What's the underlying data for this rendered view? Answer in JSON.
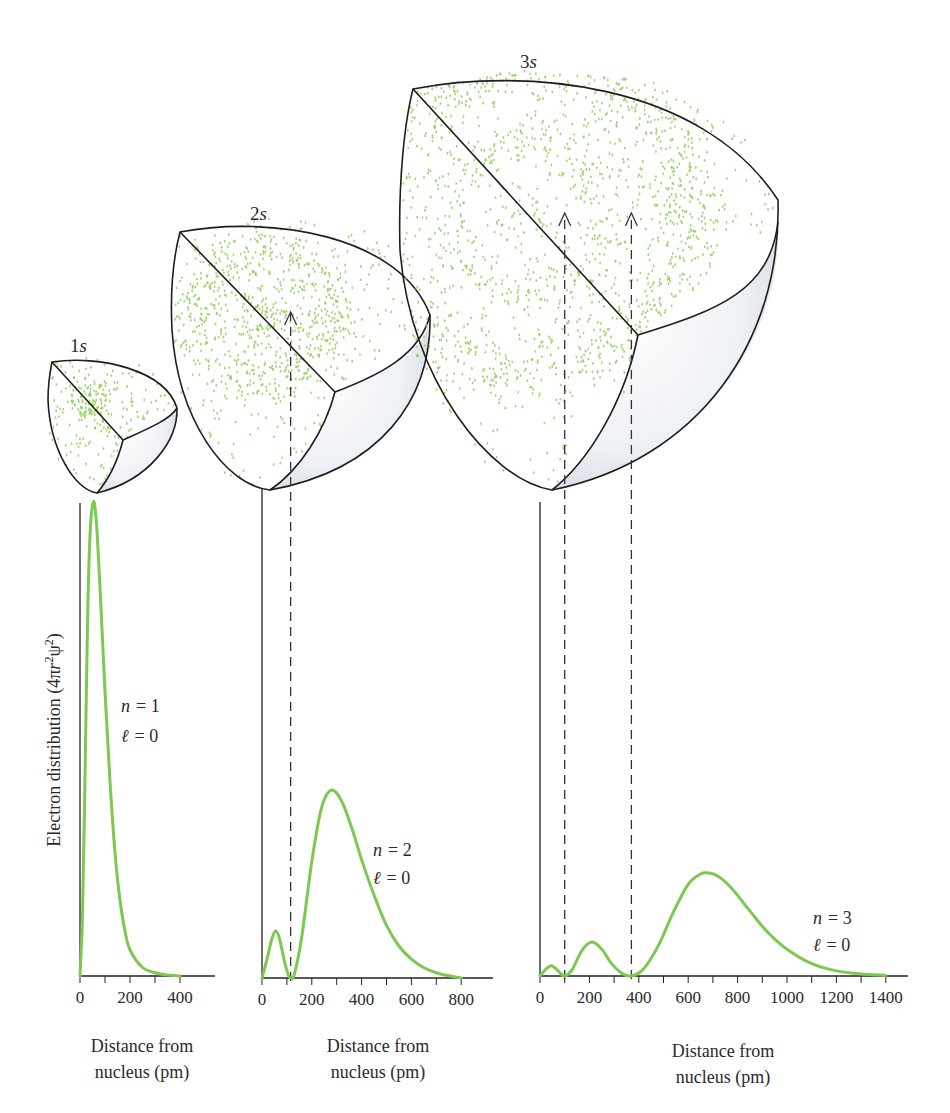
{
  "figure": {
    "ylabel": "Electron distribution (4πr²ψ²)",
    "ylabel_parts": {
      "prefix": "Electron distribution (4π",
      "r": "r",
      "sup1": "2",
      "psi": "ψ",
      "sup2": "2",
      "suffix": ")"
    },
    "orbitals": [
      {
        "label_num": "1",
        "label_sym": "s"
      },
      {
        "label_num": "2",
        "label_sym": "s"
      },
      {
        "label_num": "3",
        "label_sym": "s"
      }
    ],
    "colors": {
      "curve": "#7cc850",
      "dots": "#8fd05a",
      "outline": "#1e1e1e",
      "shade": "#d6dde6"
    }
  },
  "chart_data": [
    {
      "type": "line",
      "title": "1s",
      "xlabel": "Distance from nucleus (pm)",
      "xlabel_lines": [
        "Distance from",
        "nucleus (pm)"
      ],
      "ylabel": "Electron distribution (4πr²ψ²)",
      "annotation": {
        "n": "n = 1",
        "l": "ℓ = 0",
        "n_sym": "n",
        "n_val": "= 1",
        "l_sym": "ℓ",
        "l_val": "= 0"
      },
      "xlim": [
        0,
        540
      ],
      "xticks": [
        0,
        100,
        200,
        300,
        400
      ],
      "xtick_labels": [
        "0",
        "200",
        "400"
      ],
      "xtick_label_values": [
        0,
        200,
        400
      ],
      "nodes_pm": [],
      "x": [
        0,
        10,
        20,
        30,
        40,
        53,
        65,
        80,
        100,
        120,
        140,
        160,
        180,
        200,
        250,
        300,
        350,
        400
      ],
      "y": [
        0,
        0.13,
        0.42,
        0.74,
        0.93,
        1.0,
        0.96,
        0.82,
        0.6,
        0.41,
        0.26,
        0.16,
        0.095,
        0.055,
        0.018,
        0.007,
        0.002,
        0.0
      ]
    },
    {
      "type": "line",
      "title": "2s",
      "xlabel": "Distance from nucleus (pm)",
      "xlabel_lines": [
        "Distance from",
        "nucleus (pm)"
      ],
      "ylabel": "Electron distribution (4πr²ψ²)",
      "annotation": {
        "n": "n = 2",
        "l": "ℓ = 0",
        "n_sym": "n",
        "n_val": "= 2",
        "l_sym": "ℓ",
        "l_val": "= 0"
      },
      "xlim": [
        0,
        930
      ],
      "xticks": [
        0,
        100,
        200,
        300,
        400,
        500,
        600,
        700,
        800
      ],
      "xtick_labels": [
        "0",
        "200",
        "400",
        "600",
        "800"
      ],
      "xtick_label_values": [
        0,
        200,
        400,
        600,
        800
      ],
      "nodes_pm": [
        115
      ],
      "x": [
        0,
        20,
        40,
        55,
        70,
        90,
        105,
        115,
        130,
        160,
        200,
        240,
        280,
        320,
        360,
        400,
        450,
        500,
        550,
        600,
        650,
        700,
        750,
        800
      ],
      "y": [
        0,
        0.1,
        0.21,
        0.25,
        0.21,
        0.09,
        0.02,
        0.0,
        0.02,
        0.22,
        0.62,
        0.91,
        1.0,
        0.94,
        0.8,
        0.63,
        0.44,
        0.28,
        0.17,
        0.1,
        0.055,
        0.028,
        0.012,
        0.0
      ]
    },
    {
      "type": "line",
      "title": "3s",
      "xlabel": "Distance from nucleus (pm)",
      "xlabel_lines": [
        "Distance from",
        "nucleus (pm)"
      ],
      "ylabel": "Electron distribution (4πr²ψ²)",
      "annotation": {
        "n": "n = 3",
        "l": "ℓ = 0",
        "n_sym": "n",
        "n_val": "= 3",
        "l_sym": "ℓ",
        "l_val": "= 0"
      },
      "xlim": [
        0,
        1480
      ],
      "xticks": [
        0,
        100,
        200,
        300,
        400,
        500,
        600,
        700,
        800,
        900,
        1000,
        1100,
        1200,
        1300,
        1400
      ],
      "xtick_labels": [
        "0",
        "200",
        "400",
        "600",
        "800",
        "1000",
        "1200",
        "1400"
      ],
      "xtick_label_values": [
        0,
        200,
        400,
        600,
        800,
        1000,
        1200,
        1400
      ],
      "nodes_pm": [
        100,
        370
      ],
      "x": [
        0,
        25,
        45,
        65,
        85,
        100,
        130,
        170,
        210,
        250,
        290,
        330,
        370,
        420,
        480,
        540,
        600,
        650,
        680,
        720,
        780,
        850,
        920,
        1000,
        1100,
        1200,
        1300,
        1400
      ],
      "y": [
        0,
        0.07,
        0.1,
        0.07,
        0.02,
        0.0,
        0.06,
        0.25,
        0.33,
        0.26,
        0.12,
        0.03,
        0.0,
        0.07,
        0.3,
        0.62,
        0.89,
        0.99,
        1.0,
        0.97,
        0.84,
        0.63,
        0.43,
        0.26,
        0.12,
        0.05,
        0.02,
        0.006
      ]
    }
  ]
}
